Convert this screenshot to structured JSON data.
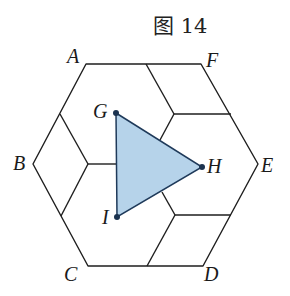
{
  "caption": "图 14",
  "colors": {
    "triangle_fill": "#b6d3ea",
    "triangle_stroke": "#1f3a5a",
    "line": "#1e1e1e",
    "point": "#1b3350",
    "background": "#ffffff"
  },
  "hexagon": {
    "vertices": [
      {
        "name": "A",
        "x": 86,
        "y": 64
      },
      {
        "name": "F",
        "x": 201,
        "y": 64
      },
      {
        "name": "E",
        "x": 258,
        "y": 164
      },
      {
        "name": "D",
        "x": 203,
        "y": 266
      },
      {
        "name": "C",
        "x": 88,
        "y": 266
      },
      {
        "name": "B",
        "x": 33,
        "y": 164
      }
    ]
  },
  "triangle": {
    "vertices": [
      {
        "name": "G",
        "x": 116,
        "y": 113
      },
      {
        "name": "H",
        "x": 202,
        "y": 167
      },
      {
        "name": "I",
        "x": 117,
        "y": 217
      }
    ]
  },
  "labels": {
    "A": "A",
    "B": "B",
    "C": "C",
    "D": "D",
    "E": "E",
    "F": "F",
    "G": "G",
    "H": "H",
    "I": "I"
  },
  "inner_segments": [
    {
      "id": "top-rhombus-1",
      "points": "146,64 174,114"
    },
    {
      "id": "top-rhombus-2",
      "points": "174,114 231,114"
    },
    {
      "id": "top-to-triangle",
      "points": "174,114 160,140"
    },
    {
      "id": "left-rhombus-1",
      "points": "60,114 88,164"
    },
    {
      "id": "left-rhombus-2",
      "points": "88,164 61,216"
    },
    {
      "id": "left-to-triangle",
      "points": "88,164 116,164"
    },
    {
      "id": "bottom-rhombus-1",
      "points": "175,215 231,215"
    },
    {
      "id": "bottom-rhombus-2",
      "points": "175,215 147,266"
    },
    {
      "id": "bottom-to-triangle",
      "points": "175,215 162,192"
    }
  ]
}
